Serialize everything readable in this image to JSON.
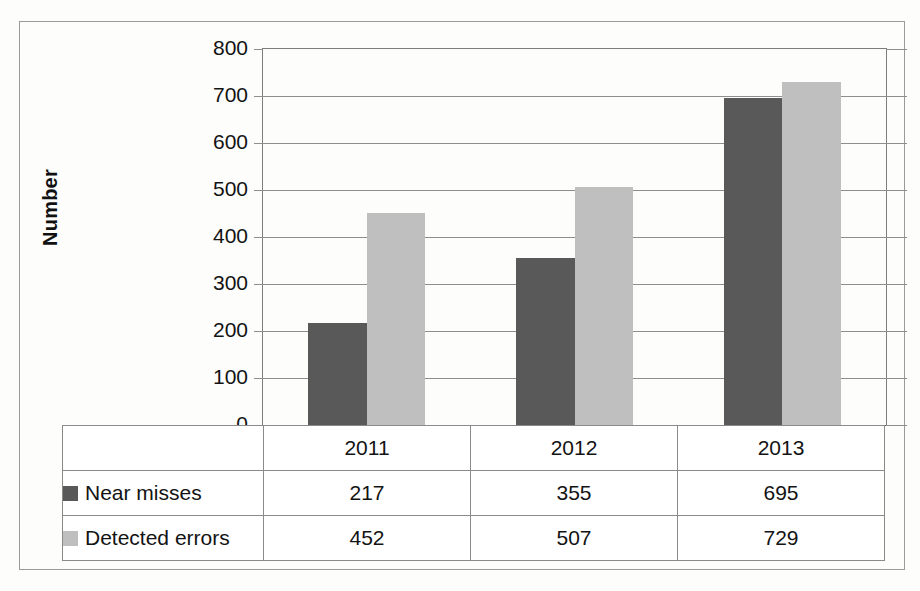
{
  "chart_data": {
    "type": "bar",
    "title": "",
    "subtitle": "",
    "xlabel": "",
    "ylabel": "Number",
    "categories": [
      "2011",
      "2012",
      "2013"
    ],
    "series": [
      {
        "name": "Near misses",
        "color": "#595959",
        "values": [
          217,
          355,
          695
        ]
      },
      {
        "name": "Detected errors",
        "color": "#bfbfbf",
        "values": [
          452,
          507,
          729
        ]
      }
    ],
    "ylim": [
      0,
      800
    ],
    "ytick_step": 100,
    "ytick_labels": [
      "800",
      "700",
      "600",
      "500",
      "400",
      "300",
      "200",
      "100",
      "0"
    ],
    "grid": "horizontal",
    "legend_position": "data-table-left-column",
    "data_table_visible": true
  },
  "table": {
    "header_row": [
      "",
      "2011",
      "2012",
      "2013"
    ],
    "rows": [
      {
        "label": "Near misses",
        "swatch": "series-0-swatch",
        "cells": [
          "217",
          "355",
          "695"
        ]
      },
      {
        "label": "Detected errors",
        "swatch": "series-1-swatch",
        "cells": [
          "452",
          "507",
          "729"
        ]
      }
    ]
  },
  "colors": {
    "series_0": "#595959",
    "series_1": "#bfbfbf",
    "gridline": "#8e8e8e",
    "frame": "#9a9a9a",
    "text": "#131313"
  }
}
